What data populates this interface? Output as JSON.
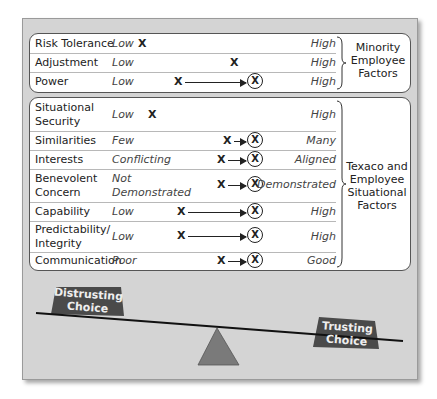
{
  "groups": {
    "minority": {
      "label_line1": "Minority",
      "label_line2": "Employee",
      "label_line3": "Factors"
    },
    "texaco": {
      "label_line1": "Texaco and",
      "label_line2": "Employee",
      "label_line3": "Situational",
      "label_line4": "Factors"
    }
  },
  "rows": [
    {
      "factor": "Risk Tolerance",
      "low": "Low",
      "high": "High",
      "from_marker": "X",
      "to_marker": ""
    },
    {
      "factor": "Adjustment",
      "low": "Low",
      "high": "High",
      "from_marker": "X",
      "to_marker": ""
    },
    {
      "factor": "Power",
      "low": "Low",
      "high": "High",
      "from_marker": "X",
      "to_marker": "X"
    },
    {
      "factor_line1": "Situational",
      "factor_line2": "Security",
      "low": "Low",
      "high": "High",
      "from_marker": "X",
      "to_marker": ""
    },
    {
      "factor": "Similarities",
      "low": "Few",
      "high": "Many",
      "from_marker": "X",
      "to_marker": "X"
    },
    {
      "factor": "Interests",
      "low": "Conflicting",
      "high": "Aligned",
      "from_marker": "X",
      "to_marker": "X"
    },
    {
      "factor_line1": "Benevolent",
      "factor_line2": "Concern",
      "low_line1": "Not",
      "low_line2": "Demonstrated",
      "high": "Demonstrated",
      "from_marker": "X",
      "to_marker": "X"
    },
    {
      "factor": "Capability",
      "low": "Low",
      "high": "High",
      "from_marker": "X",
      "to_marker": "X"
    },
    {
      "factor_line1": "Predictability/",
      "factor_line2": "Integrity",
      "low": "Low",
      "high": "High",
      "from_marker": "X",
      "to_marker": "X"
    },
    {
      "factor": "Communication",
      "low": "Poor",
      "high": "Good",
      "from_marker": "X",
      "to_marker": "X"
    }
  ],
  "seesaw": {
    "left_weight_line1": "Distrusting",
    "left_weight_line2": "Choice",
    "right_weight_line1": "Trusting",
    "right_weight_line2": "Choice"
  },
  "colors": {
    "frame_bg": "#d4d4d4",
    "panel_bg": "#ffffff",
    "weight_fill": "#4a4a4a",
    "fulcrum_fill": "#7a7a7a"
  }
}
